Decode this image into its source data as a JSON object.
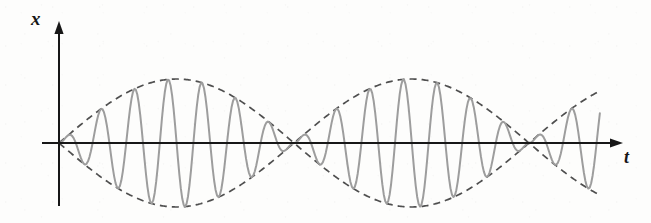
{
  "figure": {
    "background_color": "#fdfdfc",
    "width": 651,
    "height": 223
  },
  "axes": {
    "origin": {
      "x": 59,
      "y": 143
    },
    "vertical": {
      "label": "x",
      "color": "#171717",
      "stroke_width": 2,
      "x": 59,
      "y_top": 24,
      "y_bottom": 206,
      "arrow": "up"
    },
    "horizontal": {
      "label": "t",
      "color": "#171717",
      "stroke_width": 2,
      "y": 143,
      "x_left": 42,
      "x_right": 620,
      "arrow": "right"
    }
  },
  "styles": {
    "carrier_color": "#9d9d9d",
    "carrier_width": 2.0,
    "envelope_color": "#4f4f4f",
    "envelope_width": 1.7,
    "envelope_dash": "7 5"
  },
  "chart_data": {
    "type": "line",
    "title": "",
    "xlabel": "t",
    "ylabel": "x",
    "grid": false,
    "legend": null,
    "axis_arrows": true,
    "x_start": 59,
    "x_end": 600,
    "x_axis_y": 143,
    "amplitude_px": 64,
    "carrier_period_px": 33.6,
    "carrier_cycles_total": 16,
    "envelope_half_period_px": 235,
    "beat_nodes_x": [
      294,
      529
    ],
    "envelope_peaks_x": [
      176,
      411
    ],
    "envelope_peak_y_top": 79,
    "envelope_peak_y_bottom": 207,
    "series": [
      {
        "name": "carrier",
        "style": "solid",
        "color": "#9d9d9d",
        "formula": "x(t) = A * sin(pi * t / 235) * sin(2 * pi * t / 33.6)"
      },
      {
        "name": "upper envelope",
        "style": "dashed",
        "color": "#4f4f4f",
        "formula": "x(t) = +A * |sin(pi * t / 235)|"
      },
      {
        "name": "lower envelope",
        "style": "dashed",
        "color": "#4f4f4f",
        "formula": "x(t) = -A * |sin(pi * t / 235)|"
      }
    ]
  }
}
